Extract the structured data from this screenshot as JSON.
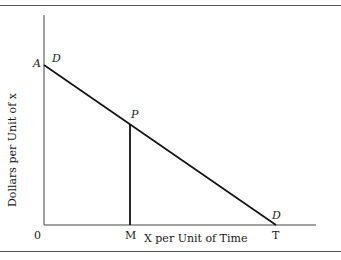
{
  "diagram": {
    "type": "demand-curve",
    "y_axis_label": "Dollars per Unit of x",
    "x_axis_label": "X per Unit of Time",
    "origin_label": "0",
    "points": {
      "A": "A",
      "D_top": "D",
      "P": "P",
      "M": "M",
      "T": "T",
      "D_bottom": "D"
    },
    "lines": [
      {
        "name": "demand-line-DD",
        "from": "A",
        "to": "T"
      },
      {
        "name": "vertical-PM",
        "from": "P",
        "to": "M"
      }
    ]
  }
}
